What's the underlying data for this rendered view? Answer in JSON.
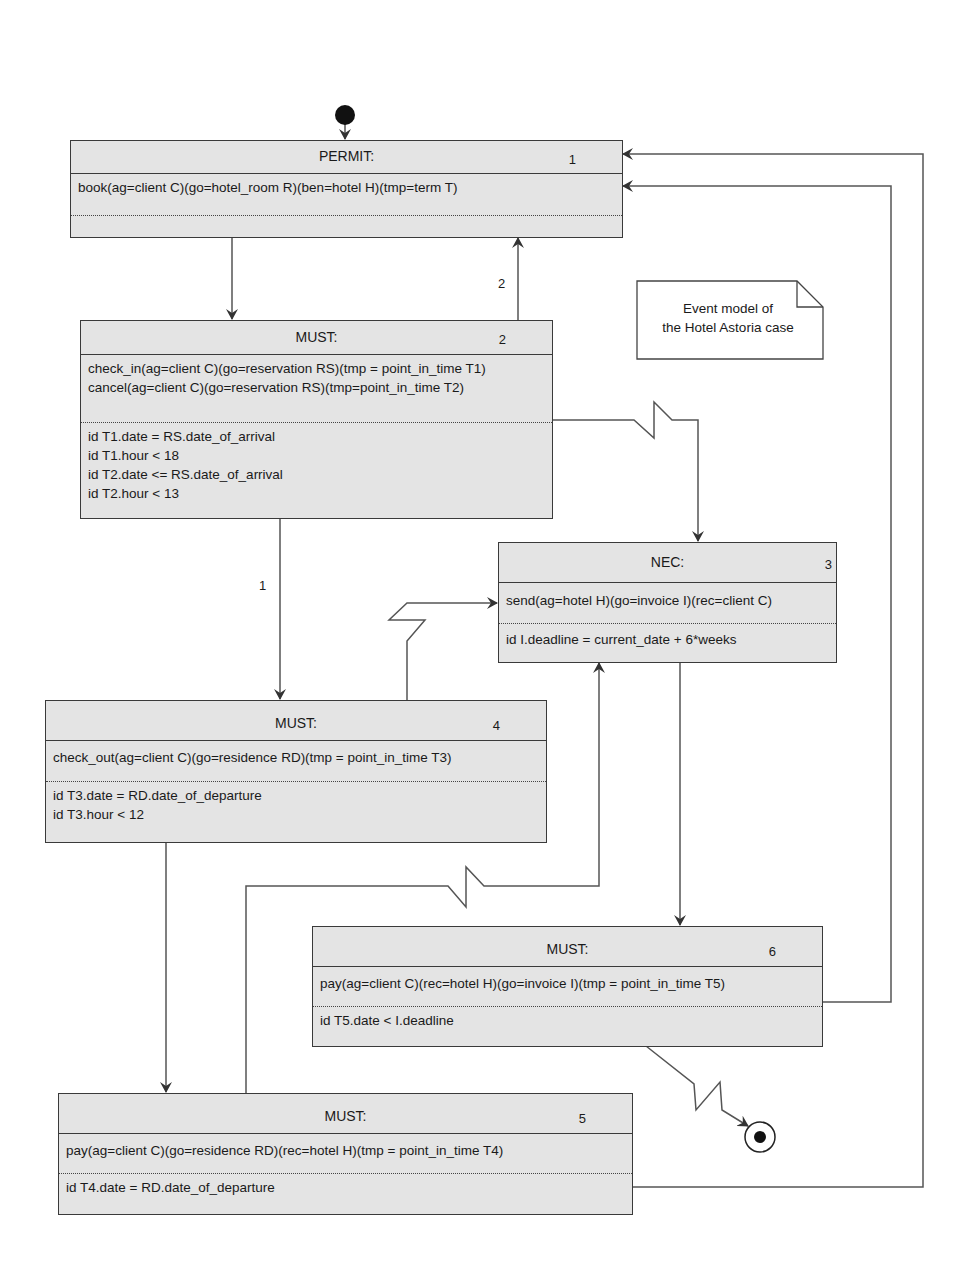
{
  "title": "Event model of the Hotel Astoria case",
  "note": {
    "line1": "Event model of",
    "line2": "the Hotel Astoria case"
  },
  "colors": {
    "box_fill": "#e4e4e4",
    "line": "#3a3a3a",
    "background": "#ffffff"
  },
  "nodes": [
    {
      "id": "1",
      "type": "PERMIT:",
      "operations": [
        "book(ag=client C)(go=hotel_room R)(ben=hotel H)(tmp=term T)"
      ],
      "conditions": []
    },
    {
      "id": "2",
      "type": "MUST:",
      "operations": [
        "check_in(ag=client C)(go=reservation RS)(tmp = point_in_time T1)",
        "cancel(ag=client C)(go=reservation RS)(tmp=point_in_time T2)"
      ],
      "conditions": [
        "id T1.date = RS.date_of_arrival",
        "id T1.hour < 18",
        "id T2.date <= RS.date_of_arrival",
        "id T2.hour < 13"
      ]
    },
    {
      "id": "3",
      "type": "NEC:",
      "operations": [
        "send(ag=hotel H)(go=invoice I)(rec=client C)"
      ],
      "conditions": [
        "id I.deadline = current_date + 6*weeks"
      ]
    },
    {
      "id": "4",
      "type": "MUST:",
      "operations": [
        "check_out(ag=client C)(go=residence RD)(tmp = point_in_time T3)"
      ],
      "conditions": [
        "id T3.date = RD.date_of_departure",
        "id T3.hour < 12"
      ]
    },
    {
      "id": "5",
      "type": "MUST:",
      "operations": [
        "pay(ag=client C)(go=residence RD)(rec=hotel H)(tmp = point_in_time T4)"
      ],
      "conditions": [
        "id T4.date = RD.date_of_departure"
      ]
    },
    {
      "id": "6",
      "type": "MUST:",
      "operations": [
        "pay(ag=client C)(rec=hotel H)(go=invoice I)(tmp = point_in_time T5)"
      ],
      "conditions": [
        "id T5.date < I.deadline"
      ]
    }
  ],
  "edges": [
    {
      "from": "start",
      "to": "1",
      "label": ""
    },
    {
      "from": "1",
      "to": "2",
      "label": ""
    },
    {
      "from": "2",
      "to": "1",
      "label": "2"
    },
    {
      "from": "2",
      "to": "4",
      "label": "1"
    },
    {
      "from": "2",
      "to": "3",
      "label": "",
      "style": "lightning"
    },
    {
      "from": "4",
      "to": "3",
      "label": "",
      "style": "lightning"
    },
    {
      "from": "4",
      "to": "5",
      "label": ""
    },
    {
      "from": "5",
      "to": "3",
      "label": "",
      "style": "lightning"
    },
    {
      "from": "3",
      "to": "6",
      "label": ""
    },
    {
      "from": "6",
      "to": "1",
      "label": ""
    },
    {
      "from": "5",
      "to": "1",
      "label": ""
    },
    {
      "from": "6",
      "to": "end",
      "label": "",
      "style": "lightning"
    }
  ],
  "edge_labels": {
    "e2_1": "2",
    "e2_4": "1"
  }
}
